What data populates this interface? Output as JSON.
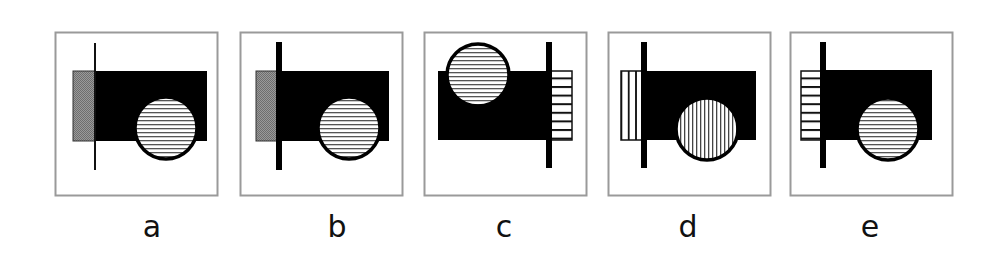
{
  "figure": {
    "type": "multiple-choice figure puzzle",
    "options": [
      {
        "label": "a",
        "line": "thin",
        "tab_fill": "gray",
        "circle_fill": "horizontal-hatch",
        "circle_position": "bottom-right",
        "line_side": "left"
      },
      {
        "label": "b",
        "line": "thick",
        "tab_fill": "gray",
        "circle_fill": "horizontal-hatch",
        "circle_position": "bottom-right",
        "line_side": "left"
      },
      {
        "label": "c",
        "line": "thick",
        "tab_fill": "horizontal-stripes",
        "circle_fill": "horizontal-hatch",
        "circle_position": "top-left",
        "line_side": "right"
      },
      {
        "label": "d",
        "line": "thick",
        "tab_fill": "vertical-stripes",
        "circle_fill": "vertical-hatch",
        "circle_position": "bottom-right",
        "line_side": "left"
      },
      {
        "label": "e",
        "line": "thick",
        "tab_fill": "horizontal-stripes",
        "circle_fill": "horizontal-hatch",
        "circle_position": "bottom-right",
        "line_side": "left"
      }
    ]
  },
  "colors": {
    "frame": "#9a9a9a",
    "shape": "#000000",
    "tab_gray": "#8c8c8c",
    "background": "#ffffff"
  }
}
